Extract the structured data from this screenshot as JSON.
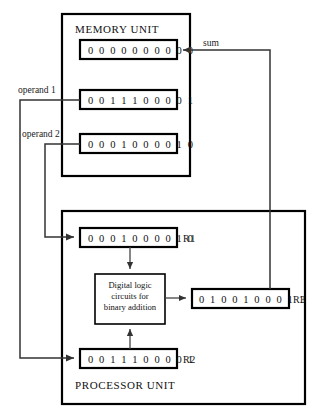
{
  "memory_unit": {
    "title": "MEMORY UNIT",
    "registers": [
      {
        "name": "memory-word-sum",
        "value": "0 0 0 0 0 0 0 0 0 0"
      },
      {
        "name": "memory-word-operand1",
        "value": "0 0 1 1 1 0 0 0 0 1"
      },
      {
        "name": "memory-word-operand2",
        "value": "0 0 0 1 0 0 0 0 1 0"
      }
    ]
  },
  "processor_unit": {
    "title": "PROCESSOR UNIT",
    "registers": [
      {
        "id": "R1",
        "label": "R1",
        "value": "0 0 0 1 0 0 0 0 1 0"
      },
      {
        "id": "R3",
        "label": "R3",
        "value": "0 1 0 0 1 0 0 0 1 1"
      },
      {
        "id": "R2",
        "label": "R2",
        "value": "0 0 1 1 1 0 0 0 0 1"
      }
    ],
    "logic_unit": {
      "line1": "Digital logic",
      "line2": "circuits for",
      "line3": "binary addition"
    }
  },
  "wire_labels": {
    "sum": "sum",
    "operand1": "operand 1",
    "operand2": "operand 2"
  },
  "colors": {
    "stroke": "#000000",
    "wire": "#333333",
    "background": "#ffffff"
  }
}
